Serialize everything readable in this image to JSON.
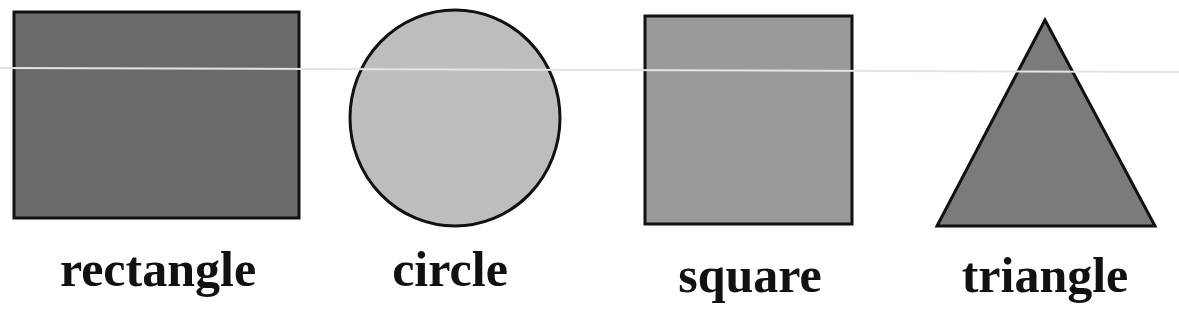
{
  "shapes": [
    {
      "name": "rectangle",
      "label": "rectangle",
      "fill": "#6b6b6b",
      "stroke": "#111111"
    },
    {
      "name": "circle",
      "label": "circle",
      "fill": "#bdbdbd",
      "stroke": "#111111"
    },
    {
      "name": "square",
      "label": "square",
      "fill": "#9a9a9a",
      "stroke": "#111111"
    },
    {
      "name": "triangle",
      "label": "triangle",
      "fill": "#7b7b7b",
      "stroke": "#111111"
    }
  ]
}
